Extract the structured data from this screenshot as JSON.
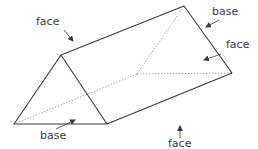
{
  "diagram": {
    "colors": {
      "edge": "#3a3a3a",
      "hidden_edge": "#9a9a9a",
      "label": "#3a3a3a",
      "background": "#ffffff"
    },
    "vertices": {
      "front_apex": [
        61,
        55
      ],
      "front_left": [
        14,
        124
      ],
      "front_right": [
        107,
        124
      ],
      "back_apex": [
        184,
        6
      ],
      "back_left": [
        137,
        74
      ],
      "back_right": [
        232,
        73
      ]
    },
    "labels": [
      {
        "id": "face-top",
        "text": "face",
        "x": 36,
        "y": 16,
        "arrow": [
          [
            64,
            30
          ],
          [
            73,
            41
          ]
        ]
      },
      {
        "id": "base-top-right",
        "text": "base",
        "x": 212,
        "y": 6,
        "arrow": [
          [
            219,
            20
          ],
          [
            206,
            27
          ]
        ]
      },
      {
        "id": "face-right",
        "text": "face",
        "x": 226,
        "y": 39,
        "arrow": [
          [
            221,
            54
          ],
          [
            204,
            60
          ]
        ]
      },
      {
        "id": "base-bottom",
        "text": "base",
        "x": 40,
        "y": 130,
        "arrow": [
          [
            56,
            129
          ],
          [
            75,
            120
          ]
        ]
      },
      {
        "id": "face-bottom",
        "text": "face",
        "x": 168,
        "y": 140,
        "arrow": [
          [
            180,
            138
          ],
          [
            180,
            126
          ]
        ]
      }
    ]
  }
}
